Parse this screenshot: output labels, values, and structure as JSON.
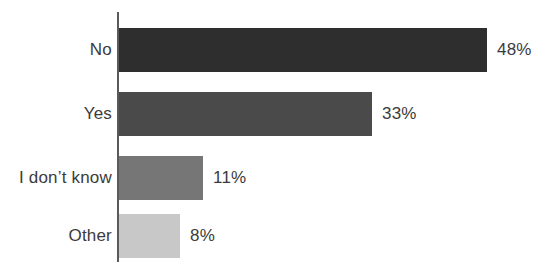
{
  "chart_data": {
    "type": "bar",
    "orientation": "horizontal",
    "title": "",
    "subtitle": "",
    "xlabel": "",
    "ylabel": "",
    "xlim": [
      0,
      48
    ],
    "grid": false,
    "legend": false,
    "axis_line_color": "#5a5a5a",
    "background_color": "#ffffff",
    "label_color": "#3b3b3b",
    "categories": [
      "No",
      "Yes",
      "I don’t know",
      "Other"
    ],
    "values": [
      48,
      33,
      11,
      8
    ],
    "value_labels": [
      "48%",
      "33%",
      "11%",
      "8%"
    ],
    "bar_colors": [
      "#2e2e2e",
      "#4a4a4a",
      "#767676",
      "#c8c8c8"
    ],
    "bars": [
      {
        "category": "No",
        "value": 48,
        "value_label": "48%",
        "color": "#2e2e2e"
      },
      {
        "category": "Yes",
        "value": 33,
        "value_label": "33%",
        "color": "#4a4a4a"
      },
      {
        "category": "I don’t know",
        "value": 11,
        "value_label": "11%",
        "color": "#767676"
      },
      {
        "category": "Other",
        "value": 8,
        "value_label": "8%",
        "color": "#c8c8c8"
      }
    ]
  },
  "layout": {
    "bar_origin_x": 119,
    "px_per_unit": 7.66,
    "bar_height": 44,
    "row_tops": [
      28,
      92,
      156,
      214
    ],
    "value_label_gap": 10
  }
}
